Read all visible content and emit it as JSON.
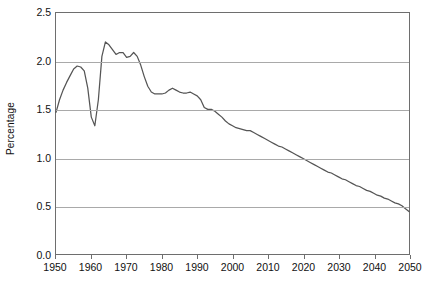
{
  "chart_data": {
    "type": "line",
    "title": "",
    "xlabel": "",
    "ylabel": "Percentage",
    "xlim": [
      1950,
      2050
    ],
    "ylim": [
      0.0,
      2.5
    ],
    "grid": true,
    "legend": "none",
    "line_color": "#555555",
    "grid_color": "#a9a9a9",
    "axis_color": "#6e6e6e",
    "x_ticks": [
      1950,
      1960,
      1970,
      1980,
      1990,
      2000,
      2010,
      2020,
      2030,
      2040,
      2050
    ],
    "x_tick_labels": [
      "1950",
      "1960",
      "1970",
      "1980",
      "1990",
      "2000",
      "2010",
      "2020",
      "2030",
      "2040",
      "2050"
    ],
    "y_ticks": [
      0.0,
      0.5,
      1.0,
      1.5,
      2.0,
      2.5
    ],
    "y_tick_labels": [
      "0.0",
      "0.5",
      "1.0",
      "1.5",
      "2.0",
      "2.5"
    ],
    "series": [
      {
        "name": "Percentage",
        "x": [
          1950,
          1951,
          1952,
          1953,
          1954,
          1955,
          1956,
          1957,
          1958,
          1959,
          1960,
          1961,
          1962,
          1963,
          1964,
          1965,
          1966,
          1967,
          1968,
          1969,
          1970,
          1971,
          1972,
          1973,
          1974,
          1975,
          1976,
          1977,
          1978,
          1979,
          1980,
          1981,
          1982,
          1983,
          1984,
          1985,
          1986,
          1987,
          1988,
          1989,
          1990,
          1991,
          1992,
          1993,
          1994,
          1995,
          1996,
          1997,
          1998,
          1999,
          2000,
          2001,
          2002,
          2003,
          2004,
          2005,
          2006,
          2007,
          2008,
          2009,
          2010,
          2011,
          2012,
          2013,
          2014,
          2015,
          2016,
          2017,
          2018,
          2019,
          2020,
          2021,
          2022,
          2023,
          2024,
          2025,
          2026,
          2027,
          2028,
          2029,
          2030,
          2031,
          2032,
          2033,
          2034,
          2035,
          2036,
          2037,
          2038,
          2039,
          2040,
          2041,
          2042,
          2043,
          2044,
          2045,
          2046,
          2047,
          2048,
          2049,
          2050
        ],
        "y": [
          1.47,
          1.6,
          1.7,
          1.78,
          1.85,
          1.92,
          1.95,
          1.94,
          1.9,
          1.72,
          1.42,
          1.33,
          1.6,
          2.05,
          2.2,
          2.17,
          2.12,
          2.07,
          2.09,
          2.09,
          2.04,
          2.05,
          2.09,
          2.05,
          1.96,
          1.84,
          1.74,
          1.68,
          1.66,
          1.66,
          1.66,
          1.67,
          1.7,
          1.72,
          1.7,
          1.68,
          1.67,
          1.67,
          1.68,
          1.66,
          1.64,
          1.6,
          1.52,
          1.5,
          1.5,
          1.48,
          1.45,
          1.42,
          1.38,
          1.35,
          1.33,
          1.31,
          1.3,
          1.29,
          1.28,
          1.28,
          1.26,
          1.24,
          1.22,
          1.2,
          1.18,
          1.16,
          1.14,
          1.12,
          1.11,
          1.09,
          1.07,
          1.05,
          1.03,
          1.01,
          0.99,
          0.97,
          0.95,
          0.93,
          0.91,
          0.89,
          0.87,
          0.85,
          0.84,
          0.82,
          0.8,
          0.78,
          0.77,
          0.75,
          0.73,
          0.71,
          0.7,
          0.68,
          0.66,
          0.65,
          0.63,
          0.61,
          0.6,
          0.58,
          0.57,
          0.55,
          0.53,
          0.52,
          0.5,
          0.47,
          0.44
        ]
      }
    ]
  }
}
